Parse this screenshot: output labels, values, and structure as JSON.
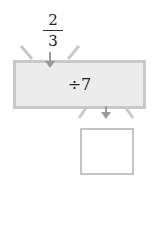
{
  "input": {
    "numerator": "2",
    "denominator": "3"
  },
  "machine": {
    "operation": "÷7"
  },
  "output": {
    "value": ""
  },
  "colors": {
    "machine_fill": "#ececec",
    "machine_border": "#c8c8c8",
    "arrow": "#9a9a9a",
    "text": "#222222"
  }
}
